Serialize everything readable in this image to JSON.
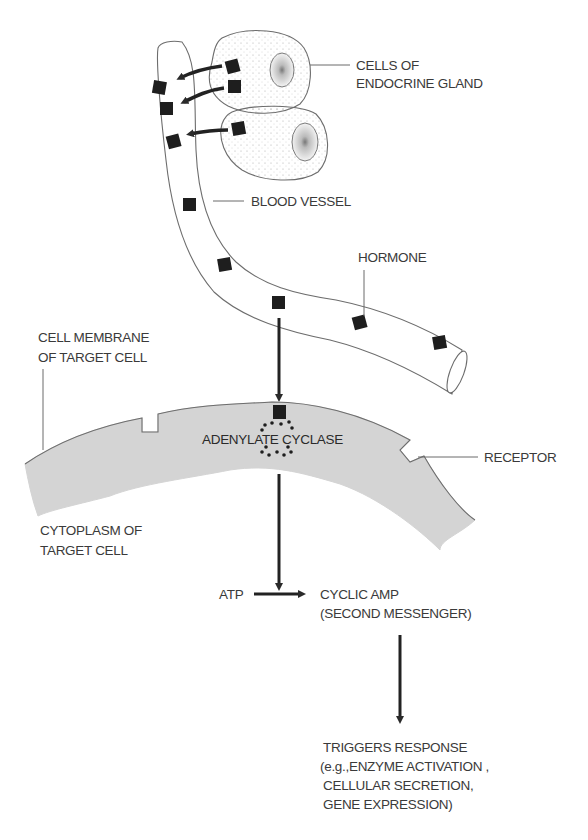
{
  "labels": {
    "endocrine_cells": [
      "CELLS OF",
      "ENDOCRINE GLAND"
    ],
    "blood_vessel": "BLOOD VESSEL",
    "hormone": "HORMONE",
    "cell_membrane": [
      "CELL MEMBRANE",
      "OF TARGET CELL"
    ],
    "adenylate_cyclase": "ADENYLATE CYCLASE",
    "receptor": "RECEPTOR",
    "cytoplasm": [
      "CYTOPLASM OF",
      "TARGET CELL"
    ],
    "atp": "ATP",
    "cyclic_amp": [
      "CYCLIC AMP",
      "(SECOND MESSENGER)"
    ],
    "response": [
      "TRIGGERS RESPONSE",
      "(e.g.,ENZYME ACTIVATION ,",
      "CELLULAR SECRETION,",
      "GENE EXPRESSION)"
    ]
  },
  "colors": {
    "membrane_fill": "#d4d4d4",
    "hormone": "#1e1e1e",
    "outline": "#6d6d6d",
    "text": "#3a3a3a"
  }
}
